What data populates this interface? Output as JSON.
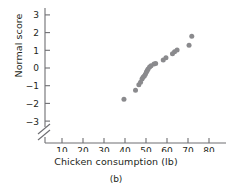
{
  "figure": {
    "caption": "(b)"
  },
  "chart_data": {
    "type": "scatter",
    "title": "",
    "xlabel": "Chicken consumption (lb)",
    "ylabel": "Normal score",
    "xlim": [
      5,
      85
    ],
    "ylim": [
      -3.6,
      3.6
    ],
    "grid": false,
    "legend": "none",
    "axis_break": "y-axis below -3",
    "point_color": "#8a8a8d",
    "xticks": [
      10,
      20,
      30,
      40,
      50,
      60,
      70,
      80
    ],
    "yticks": [
      -3,
      -2,
      -1,
      0,
      1,
      2,
      3
    ],
    "xtick_labels": [
      "10",
      "20",
      "30",
      "40",
      "50",
      "60",
      "70",
      "80"
    ],
    "ytick_labels": [
      "−3",
      "−2",
      "−1",
      "0",
      "1",
      "2",
      "3"
    ],
    "points": [
      {
        "x": 39.5,
        "y": -1.77
      },
      {
        "x": 45.0,
        "y": -1.25
      },
      {
        "x": 46.6,
        "y": -0.95
      },
      {
        "x": 47.4,
        "y": -0.8
      },
      {
        "x": 48.1,
        "y": -0.62
      },
      {
        "x": 48.6,
        "y": -0.52
      },
      {
        "x": 49.2,
        "y": -0.45
      },
      {
        "x": 49.7,
        "y": -0.36
      },
      {
        "x": 50.2,
        "y": -0.23
      },
      {
        "x": 50.6,
        "y": -0.14
      },
      {
        "x": 51.0,
        "y": -0.05
      },
      {
        "x": 51.7,
        "y": 0.05
      },
      {
        "x": 52.4,
        "y": 0.13
      },
      {
        "x": 53.8,
        "y": 0.22
      },
      {
        "x": 54.6,
        "y": 0.26
      },
      {
        "x": 58.2,
        "y": 0.45
      },
      {
        "x": 59.5,
        "y": 0.58
      },
      {
        "x": 62.6,
        "y": 0.8
      },
      {
        "x": 63.6,
        "y": 0.92
      },
      {
        "x": 64.8,
        "y": 1.02
      },
      {
        "x": 70.5,
        "y": 1.28
      },
      {
        "x": 71.8,
        "y": 1.8
      }
    ]
  }
}
